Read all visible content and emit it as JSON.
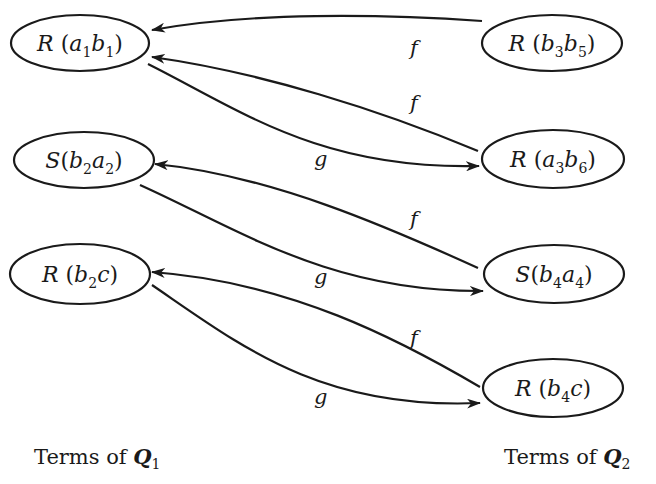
{
  "diagram": {
    "left_column": {
      "caption": "Terms of",
      "caption_var": "Q",
      "caption_sub": "1",
      "nodes": [
        {
          "id": "L1",
          "pred": "R",
          "args": [
            {
              "v": "a",
              "s": "1"
            },
            {
              "v": "b",
              "s": "1"
            }
          ],
          "text": "R (a1b1)"
        },
        {
          "id": "L2",
          "pred": "S",
          "args": [
            {
              "v": "b",
              "s": "2"
            },
            {
              "v": "a",
              "s": "2"
            }
          ],
          "text": "S (b2a2)"
        },
        {
          "id": "L3",
          "pred": "R",
          "args": [
            {
              "v": "b",
              "s": "2"
            },
            {
              "v": "c",
              "s": ""
            }
          ],
          "text": "R (b2c)"
        }
      ]
    },
    "right_column": {
      "caption": "Terms of",
      "caption_var": "Q",
      "caption_sub": "2",
      "nodes": [
        {
          "id": "R1",
          "pred": "R",
          "args": [
            {
              "v": "b",
              "s": "3"
            },
            {
              "v": "b",
              "s": "5"
            }
          ],
          "text": "R (b3b5)"
        },
        {
          "id": "R2",
          "pred": "R",
          "args": [
            {
              "v": "a",
              "s": "3"
            },
            {
              "v": "b",
              "s": "6"
            }
          ],
          "text": "R (a3b6)"
        },
        {
          "id": "R3",
          "pred": "S",
          "args": [
            {
              "v": "b",
              "s": "4"
            },
            {
              "v": "a",
              "s": "4"
            }
          ],
          "text": "S (b4a4)"
        },
        {
          "id": "R4",
          "pred": "R",
          "args": [
            {
              "v": "b",
              "s": "4"
            },
            {
              "v": "c",
              "s": ""
            }
          ],
          "text": "R (b4c)"
        }
      ]
    },
    "edges": [
      {
        "from": "R1",
        "to": "L1",
        "label": "f"
      },
      {
        "from": "R2",
        "to": "L1",
        "label": "f"
      },
      {
        "from": "L1",
        "to": "R2",
        "label": "g"
      },
      {
        "from": "R3",
        "to": "L2",
        "label": "f"
      },
      {
        "from": "L2",
        "to": "R3",
        "label": "g"
      },
      {
        "from": "R4",
        "to": "L3",
        "label": "f"
      },
      {
        "from": "L3",
        "to": "R4",
        "label": "g"
      }
    ]
  }
}
